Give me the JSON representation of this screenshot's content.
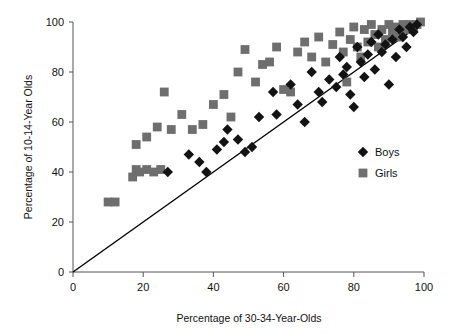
{
  "chart_data": {
    "type": "scatter",
    "title": "",
    "xlabel": "Percentage of 30-34-Year-Olds",
    "ylabel": "Percentage of 10-14-Year Olds",
    "xlim": [
      0,
      100
    ],
    "ylim": [
      0,
      100
    ],
    "xticks": [
      0,
      20,
      40,
      60,
      80,
      100
    ],
    "yticks": [
      0,
      20,
      40,
      60,
      80,
      100
    ],
    "grid": false,
    "legend_position": "inside-right",
    "reference_line": {
      "name": "identity-line",
      "from": [
        0,
        0
      ],
      "to": [
        100,
        100
      ],
      "color": "#000000"
    },
    "series": [
      {
        "name": "Boys",
        "marker": "diamond",
        "color": "#131313",
        "points": [
          [
            27,
            40
          ],
          [
            33,
            47
          ],
          [
            36,
            44
          ],
          [
            41,
            49
          ],
          [
            44,
            57
          ],
          [
            38,
            40
          ],
          [
            43,
            52
          ],
          [
            47,
            53
          ],
          [
            49,
            48
          ],
          [
            51,
            50
          ],
          [
            53,
            62
          ],
          [
            57,
            72
          ],
          [
            58,
            63
          ],
          [
            62,
            75
          ],
          [
            64,
            67
          ],
          [
            66,
            60
          ],
          [
            68,
            80
          ],
          [
            70,
            72
          ],
          [
            71,
            68
          ],
          [
            73,
            77
          ],
          [
            75,
            74
          ],
          [
            76,
            86
          ],
          [
            77,
            79
          ],
          [
            78,
            82
          ],
          [
            79,
            71
          ],
          [
            80,
            66
          ],
          [
            81,
            90
          ],
          [
            82,
            84
          ],
          [
            83,
            78
          ],
          [
            84,
            87
          ],
          [
            85,
            92
          ],
          [
            86,
            81
          ],
          [
            87,
            95
          ],
          [
            88,
            88
          ],
          [
            89,
            91
          ],
          [
            90,
            75
          ],
          [
            91,
            93
          ],
          [
            92,
            86
          ],
          [
            93,
            97
          ],
          [
            94,
            94
          ],
          [
            95,
            90
          ],
          [
            96,
            98
          ],
          [
            97,
            96
          ],
          [
            98,
            99
          ]
        ]
      },
      {
        "name": "Girls",
        "marker": "square",
        "color": "#6e6e6e",
        "points": [
          [
            10,
            28
          ],
          [
            12,
            28
          ],
          [
            17,
            38
          ],
          [
            18,
            41
          ],
          [
            19,
            40
          ],
          [
            21,
            41
          ],
          [
            23,
            40
          ],
          [
            25,
            41
          ],
          [
            18,
            51
          ],
          [
            21,
            54
          ],
          [
            24,
            58
          ],
          [
            26,
            72
          ],
          [
            28,
            57
          ],
          [
            31,
            63
          ],
          [
            34,
            57
          ],
          [
            37,
            59
          ],
          [
            40,
            67
          ],
          [
            43,
            71
          ],
          [
            45,
            62
          ],
          [
            47,
            80
          ],
          [
            49,
            89
          ],
          [
            52,
            76
          ],
          [
            54,
            83
          ],
          [
            56,
            84
          ],
          [
            58,
            90
          ],
          [
            60,
            73
          ],
          [
            62,
            72
          ],
          [
            64,
            88
          ],
          [
            66,
            92
          ],
          [
            68,
            86
          ],
          [
            70,
            94
          ],
          [
            72,
            84
          ],
          [
            74,
            91
          ],
          [
            76,
            96
          ],
          [
            77,
            88
          ],
          [
            78,
            76
          ],
          [
            79,
            93
          ],
          [
            80,
            98
          ],
          [
            81,
            90
          ],
          [
            82,
            86
          ],
          [
            83,
            97
          ],
          [
            84,
            92
          ],
          [
            85,
            99
          ],
          [
            86,
            95
          ],
          [
            87,
            90
          ],
          [
            88,
            97
          ],
          [
            89,
            93
          ],
          [
            90,
            99
          ],
          [
            91,
            96
          ],
          [
            92,
            98
          ],
          [
            93,
            94
          ],
          [
            94,
            99
          ],
          [
            95,
            97
          ],
          [
            96,
            99
          ],
          [
            97,
            98
          ],
          [
            98,
            99
          ],
          [
            99,
            100
          ]
        ]
      }
    ]
  },
  "legend": {
    "items": [
      {
        "label": "Boys",
        "marker": "diamond",
        "color": "#131313"
      },
      {
        "label": "Girls",
        "marker": "square",
        "color": "#6e6e6e"
      }
    ]
  },
  "axes": {
    "x": {
      "title": "Percentage of 30-34-Year-Olds",
      "labels": [
        "0",
        "20",
        "40",
        "60",
        "80",
        "100"
      ]
    },
    "y": {
      "title": "Percentage of 10-14-Year Olds",
      "labels": [
        "0",
        "20",
        "40",
        "60",
        "80",
        "100"
      ]
    }
  }
}
